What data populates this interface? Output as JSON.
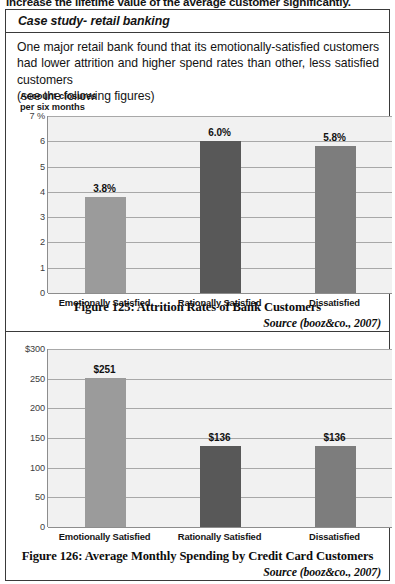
{
  "page": {
    "cutoff_line": "increase the lifetime value of the average customer significantly.",
    "case_title": "Case study- retail banking",
    "paragraph_line1": "One major retail bank found that its emotionally-satisfied customers had",
    "paragraph_line2": "lower attrition and higher spend rates than other, less satisfied customers",
    "paragraph_line3": "(see the following figures)"
  },
  "chart_data": [
    {
      "id": "figure-125",
      "type": "bar",
      "title": "",
      "axis_title": "Account closures\nper six months",
      "xlabel": "",
      "ylabel": "Account closures per six months",
      "categories": [
        "Emotionally Satisfied",
        "Rationally Satisfied",
        "Dissatisfied"
      ],
      "values": [
        3.8,
        6.0,
        5.8
      ],
      "data_labels": [
        "3.8%",
        "6.0%",
        "5.8%"
      ],
      "ytick_labels": [
        "7 %",
        "6",
        "5",
        "4",
        "3",
        "2",
        "1",
        "0"
      ],
      "ytick_values": [
        7,
        6,
        5,
        4,
        3,
        2,
        1,
        0
      ],
      "ylim": [
        0,
        7
      ],
      "grid": true,
      "legend": "none",
      "bar_colors": [
        "#9b9b9b",
        "#585858",
        "#7d7d7d"
      ],
      "plot_background": "#f1f1f1",
      "caption": "Figure 125: Attrition Rates of Bank Customers",
      "source": "Source (booz&co., 2007)"
    },
    {
      "id": "figure-126",
      "type": "bar",
      "title": "",
      "axis_title": "",
      "xlabel": "",
      "ylabel": "",
      "categories": [
        "Emotionally Satisfied",
        "Rationally Satisfied",
        "Dissatisfied"
      ],
      "values": [
        251,
        136,
        136
      ],
      "data_labels": [
        "$251",
        "$136",
        "$136"
      ],
      "ytick_labels": [
        "$300",
        "250",
        "200",
        "150",
        "100",
        "50",
        "0"
      ],
      "ytick_values": [
        300,
        250,
        200,
        150,
        100,
        50,
        0
      ],
      "ylim": [
        0,
        300
      ],
      "grid": true,
      "legend": "none",
      "bar_colors": [
        "#9b9b9b",
        "#585858",
        "#7d7d7d"
      ],
      "plot_background": "#f1f1f1",
      "caption": "Figure 126: Average Monthly Spending by Credit Card Customers",
      "source": "Source (booz&co., 2007)"
    }
  ]
}
